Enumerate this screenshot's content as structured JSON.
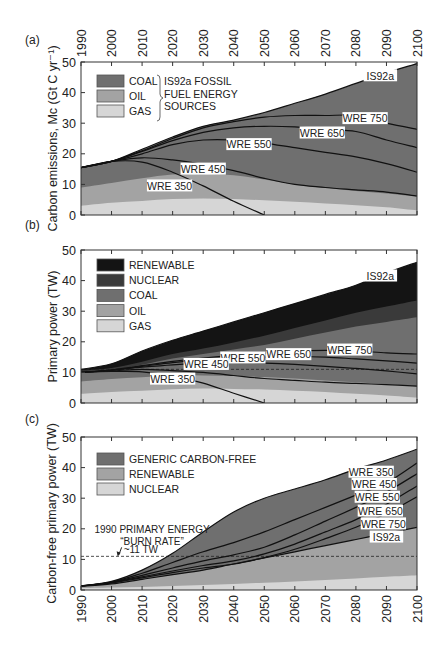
{
  "figure": {
    "colors": {
      "coal": "#6f6f6f",
      "oil": "#a3a3a3",
      "gas": "#d6d6d6",
      "nuclear": "#3a3a3a",
      "renewable": "#141414",
      "generic_carbon_free": "#6f6f6f",
      "c_renewable": "#a3a3a3",
      "c_nuclear": "#d6d6d6",
      "axis": "#333333",
      "curve": "#111111",
      "background": "#ffffff"
    }
  },
  "chart_data": [
    {
      "panel": "(a)",
      "type": "area",
      "title": "",
      "xlabel": "",
      "ylabel": "Carbon emissions, Mc (Gt C yr⁻¹)",
      "xlim": [
        1990,
        2100
      ],
      "ylim": [
        0,
        50
      ],
      "x_ticks": [
        1990,
        2000,
        2010,
        2020,
        2030,
        2040,
        2050,
        2060,
        2070,
        2080,
        2090,
        2100
      ],
      "x_tick_position": "top",
      "y_ticks": [
        0,
        10,
        20,
        30,
        40,
        50
      ],
      "legend": {
        "entries": [
          "COAL",
          "OIL",
          "GAS"
        ],
        "bracket_label": [
          "IS92a FOSSIL",
          "FUEL ENERGY",
          "SOURCES"
        ],
        "position": "upper-left"
      },
      "x": [
        1990,
        2000,
        2010,
        2020,
        2030,
        2040,
        2050,
        2060,
        2070,
        2080,
        2090,
        2100
      ],
      "stacked_series": [
        {
          "name": "GAS",
          "cumulative_top": [
            3,
            4,
            4.6,
            5.2,
            5.4,
            5.2,
            4.8,
            4.3,
            3.8,
            3.2,
            2.5,
            1.5
          ]
        },
        {
          "name": "OIL",
          "cumulative_top": [
            9,
            10.5,
            12,
            13.2,
            13.4,
            13,
            11.6,
            10,
            8.8,
            7.8,
            7,
            6
          ]
        },
        {
          "name": "COAL",
          "cumulative_top": [
            15.5,
            17.5,
            21.5,
            25.5,
            29,
            31,
            33.5,
            36.5,
            39.5,
            43,
            46.5,
            49.5
          ]
        }
      ],
      "curves": [
        {
          "name": "IS92a",
          "values": [
            15.5,
            17.5,
            21.5,
            25.5,
            29,
            31,
            33.5,
            36.5,
            39.5,
            43,
            46.5,
            49.5
          ],
          "label_at": [
            2088,
            45.5
          ]
        },
        {
          "name": "WRE 750",
          "values": [
            15.5,
            17.5,
            21,
            25,
            28.5,
            30.5,
            32,
            32.5,
            32.5,
            32.5,
            30,
            28
          ],
          "label_at": [
            2083,
            31.5
          ]
        },
        {
          "name": "WRE 650",
          "values": [
            15.5,
            17.5,
            20.8,
            24.3,
            27,
            28.5,
            29,
            28.8,
            28,
            27.3,
            24.5,
            22
          ],
          "label_at": [
            2069,
            26.8
          ]
        },
        {
          "name": "WRE 550",
          "values": [
            15.5,
            17.5,
            20,
            23,
            24.5,
            24.5,
            23.5,
            22,
            20.5,
            19,
            16.8,
            14
          ],
          "label_at": [
            2045,
            23
          ]
        },
        {
          "name": "WRE 450",
          "values": [
            15.5,
            17.5,
            18.7,
            18,
            16.5,
            14.5,
            12,
            10,
            9,
            8.2,
            7.5,
            6.2
          ],
          "label_at": [
            2030,
            15
          ]
        },
        {
          "name": "WRE 350",
          "values": [
            15.5,
            17.5,
            17.3,
            14,
            9.5,
            4.5,
            0,
            null,
            null,
            null,
            null,
            null
          ],
          "label_at": [
            2019,
            9.5
          ]
        }
      ]
    },
    {
      "panel": "(b)",
      "type": "area",
      "title": "",
      "xlabel": "",
      "ylabel": "Primary power (TW)",
      "xlim": [
        1990,
        2100
      ],
      "ylim": [
        0,
        50
      ],
      "x_ticks": [
        1990,
        2000,
        2010,
        2020,
        2030,
        2040,
        2050,
        2060,
        2070,
        2080,
        2090,
        2100
      ],
      "y_ticks": [
        0,
        10,
        20,
        30,
        40,
        50
      ],
      "legend": {
        "entries": [
          "RENEWABLE",
          "NUCLEAR",
          "COAL",
          "OIL",
          "GAS"
        ],
        "position": "upper-left"
      },
      "reference_line": {
        "y": 11,
        "style": "dashed"
      },
      "x": [
        1990,
        2000,
        2010,
        2020,
        2030,
        2040,
        2050,
        2060,
        2070,
        2080,
        2090,
        2100
      ],
      "stacked_series": [
        {
          "name": "GAS",
          "cumulative_top": [
            3,
            3.6,
            4,
            4.5,
            4.7,
            4.6,
            4.4,
            4,
            3.6,
            3,
            2.5,
            1.8
          ]
        },
        {
          "name": "OIL",
          "cumulative_top": [
            7,
            7.8,
            8.4,
            9,
            9,
            8.8,
            8.5,
            8,
            7.4,
            6.8,
            6.2,
            5.5
          ]
        },
        {
          "name": "COAL",
          "cumulative_top": [
            10,
            10.8,
            12.5,
            14.5,
            16,
            17.5,
            19,
            21,
            23,
            25,
            26.5,
            28
          ]
        },
        {
          "name": "NUCLEAR",
          "cumulative_top": [
            10.6,
            11.4,
            13.5,
            16,
            17.8,
            19.8,
            22,
            24.5,
            27,
            29.5,
            31.5,
            33.5
          ]
        },
        {
          "name": "RENEWABLE",
          "cumulative_top": [
            11,
            12.8,
            17,
            20.5,
            23.5,
            26.5,
            29.5,
            32.5,
            35.5,
            38.5,
            42.5,
            46
          ]
        }
      ],
      "curves": [
        {
          "name": "IS92a",
          "values": [
            11,
            12.8,
            17,
            20.5,
            23.5,
            26.5,
            29.5,
            32.5,
            35.5,
            38.5,
            42.5,
            46
          ],
          "label_at": [
            2088,
            41.5
          ]
        },
        {
          "name": "WRE 750",
          "values": [
            10,
            10.8,
            12.2,
            13.6,
            14.7,
            15.6,
            16.3,
            17,
            17.2,
            17,
            16.4,
            16
          ],
          "label_at": [
            2078,
            17.3
          ]
        },
        {
          "name": "WRE 650",
          "values": [
            10,
            10.8,
            12,
            13.2,
            14.1,
            14.7,
            15,
            15.2,
            15,
            14.4,
            13.8,
            13
          ],
          "label_at": [
            2058,
            15.8
          ]
        },
        {
          "name": "WRE 550",
          "values": [
            10,
            10.7,
            11.7,
            12.5,
            13,
            13.2,
            13,
            12.6,
            12,
            11.3,
            10.5,
            9.5
          ],
          "label_at": [
            2043,
            14.7
          ]
        },
        {
          "name": "WRE 450",
          "values": [
            10,
            10.5,
            11,
            10.6,
            10,
            9,
            8,
            7.4,
            6.8,
            6.4,
            6,
            5.5
          ],
          "label_at": [
            2031,
            12.6
          ]
        },
        {
          "name": "WRE 350",
          "values": [
            10,
            10.3,
            10.2,
            8.8,
            6.5,
            3.2,
            0,
            null,
            null,
            null,
            null,
            null
          ],
          "label_at": [
            2020,
            7.8
          ]
        }
      ]
    },
    {
      "panel": "(c)",
      "type": "area",
      "title": "",
      "xlabel": "",
      "ylabel": "Carbon-free primary power (TW)",
      "xlim": [
        1990,
        2100
      ],
      "ylim": [
        0,
        50
      ],
      "x_ticks": [
        1990,
        2000,
        2010,
        2020,
        2030,
        2040,
        2050,
        2060,
        2070,
        2080,
        2090,
        2100
      ],
      "x_tick_position": "bottom",
      "y_ticks": [
        0,
        10,
        20,
        30,
        40,
        50
      ],
      "legend": {
        "entries": [
          "GENERIC CARBON-FREE",
          "RENEWABLE",
          "NUCLEAR"
        ],
        "position": "upper-left"
      },
      "reference_line": {
        "y": 11,
        "style": "dashed"
      },
      "annotation": {
        "lines": [
          "1990 PRIMARY ENERGY",
          "“BURN RATE”",
          "~11 TW"
        ],
        "arrow_to": [
          2002,
          11
        ]
      },
      "x": [
        1990,
        2000,
        2010,
        2020,
        2030,
        2040,
        2050,
        2060,
        2070,
        2080,
        2090,
        2100
      ],
      "stacked_series": [
        {
          "name": "NUCLEAR",
          "cumulative_top": [
            0.6,
            0.8,
            1,
            1.3,
            1.6,
            2,
            2.4,
            2.8,
            3.3,
            3.8,
            4.3,
            4.8
          ]
        },
        {
          "name": "RENEWABLE",
          "cumulative_top": [
            1.2,
            2,
            3.5,
            5,
            6.5,
            8.5,
            10.5,
            12.5,
            14.5,
            16.5,
            18.5,
            20.5
          ]
        },
        {
          "name": "GENERIC CARBON-FREE",
          "cumulative_top": [
            1.3,
            2.8,
            6.5,
            12,
            19,
            25.5,
            30,
            33,
            36,
            39.5,
            42.5,
            46
          ]
        }
      ],
      "curves": [
        {
          "name": "WRE 350",
          "values": [
            1.3,
            2.8,
            6.5,
            12,
            19,
            25.5,
            30,
            33,
            36,
            39.5,
            42.5,
            46
          ],
          "label_at": [
            2085,
            38.5
          ]
        },
        {
          "name": "WRE 450",
          "values": [
            1.3,
            2.6,
            5.5,
            9,
            12.5,
            15.5,
            19,
            23,
            27,
            31,
            35,
            41.5
          ],
          "label_at": [
            2086,
            34.5
          ]
        },
        {
          "name": "WRE 550",
          "values": [
            1.3,
            2.5,
            4.8,
            7.2,
            9.5,
            11.5,
            14,
            18,
            22.5,
            27,
            32,
            38
          ],
          "label_at": [
            2087,
            30.3
          ]
        },
        {
          "name": "WRE 650",
          "values": [
            1.3,
            2.4,
            4.3,
            6.2,
            8,
            9.5,
            11.8,
            15,
            19,
            23,
            28,
            34
          ],
          "label_at": [
            2088,
            25.8
          ]
        },
        {
          "name": "WRE 750",
          "values": [
            1.3,
            2.3,
            4,
            5.7,
            7.2,
            8.5,
            10.6,
            13.3,
            16.8,
            20.5,
            25,
            30.5
          ],
          "label_at": [
            2089,
            21.6
          ]
        },
        {
          "name": "IS92a",
          "values": [
            1.2,
            2,
            3.5,
            5,
            6.5,
            8.5,
            10.5,
            12.5,
            14.5,
            16.5,
            18.5,
            20.5
          ],
          "label_at": [
            2090,
            17.3
          ]
        }
      ]
    }
  ]
}
